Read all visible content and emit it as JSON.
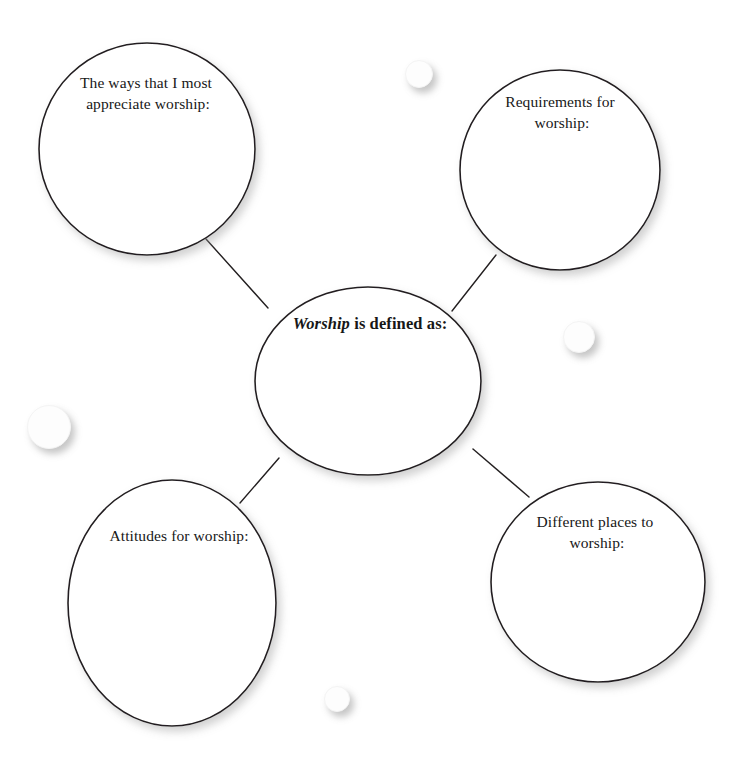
{
  "page": {
    "background_color": "#ffffff",
    "ink_color": "#231f20",
    "width": 735,
    "height": 771
  },
  "diagram": {
    "type": "mind-map",
    "center": {
      "id": "center",
      "shape": "ellipse",
      "cx": 368,
      "cy": 381,
      "rx": 113,
      "ry": 94,
      "label_keyword": "Worship",
      "label_rest": " is defined as:",
      "label_full": "Worship is defined as:",
      "label_lines": [
        "Worship is defined as:"
      ],
      "label_y": 329
    },
    "nodes": [
      {
        "id": "top-left",
        "shape": "circle",
        "cx": 147,
        "cy": 149,
        "rx": 108,
        "ry": 106,
        "label": "The ways that I most appreciate worship:",
        "label_lines": [
          "The ways that I most",
          "appreciate worship:"
        ],
        "label_x": 148,
        "label_y": 88
      },
      {
        "id": "top-right",
        "shape": "circle",
        "cx": 560,
        "cy": 170,
        "rx": 100,
        "ry": 100,
        "label": "Requirements for worship:",
        "label_lines": [
          "Requirements for",
          "worship:"
        ],
        "label_x": 562,
        "label_y": 107
      },
      {
        "id": "bottom-left",
        "shape": "ellipse",
        "cx": 172,
        "cy": 603,
        "rx": 104,
        "ry": 123,
        "label": "Attitudes for worship:",
        "label_lines": [
          "Attitudes for worship:"
        ],
        "label_x": 179,
        "label_y": 541
      },
      {
        "id": "bottom-right",
        "shape": "ellipse",
        "cx": 598,
        "cy": 582,
        "rx": 107,
        "ry": 100,
        "label": "Different places to worship:",
        "label_lines": [
          "Different places to",
          "worship:"
        ],
        "label_x": 597,
        "label_y": 527
      }
    ],
    "connectors": [
      {
        "id": "center-to-top-left",
        "x1": 206,
        "y1": 239,
        "x2": 268,
        "y2": 308
      },
      {
        "id": "center-to-top-right",
        "x1": 496,
        "y1": 255,
        "x2": 452,
        "y2": 311
      },
      {
        "id": "center-to-bottom-left",
        "x1": 279,
        "y1": 458,
        "x2": 240,
        "y2": 503
      },
      {
        "id": "center-to-bottom-right",
        "x1": 473,
        "y1": 449,
        "x2": 529,
        "y2": 497
      }
    ],
    "specks": [
      {
        "id": "speck-top",
        "x": 405,
        "y": 60,
        "size": 26
      },
      {
        "id": "speck-right",
        "x": 563,
        "y": 321,
        "size": 30
      },
      {
        "id": "speck-left",
        "x": 27,
        "y": 405,
        "size": 42
      },
      {
        "id": "speck-bottom",
        "x": 324,
        "y": 686,
        "size": 24
      }
    ]
  }
}
